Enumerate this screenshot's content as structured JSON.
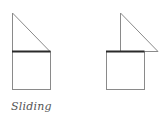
{
  "caption": "Sliding",
  "colors": {
    "outline": "#8a8a8a",
    "edge": "#2a2a2a",
    "background": "#ffffff",
    "caption": "#555555"
  },
  "figures": [
    {
      "name": "before",
      "description": "triangle resting on square, edges aligned"
    },
    {
      "name": "after",
      "description": "triangle slid right along shared edge"
    }
  ]
}
